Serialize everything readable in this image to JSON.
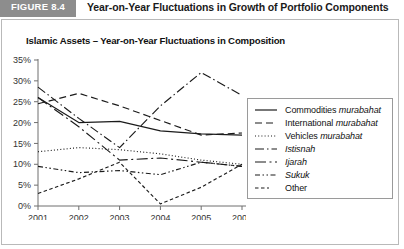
{
  "figure": {
    "badge": "FIGURE 8.4",
    "header_title": "Year-on-Year Fluctuations in Growth of Portfolio Components"
  },
  "chart_data": {
    "type": "line",
    "title": "Islamic Assets – Year-on-Year Fluctuations in Composition",
    "xlabel": "",
    "ylabel": "",
    "categories": [
      "2001",
      "2002",
      "2003",
      "2004",
      "2005",
      "2006"
    ],
    "x": [
      2001,
      2002,
      2003,
      2004,
      2005,
      2006
    ],
    "ylim": [
      0,
      35
    ],
    "yticks": [
      0,
      5,
      10,
      15,
      20,
      25,
      30,
      35
    ],
    "ytick_labels": [
      "0%",
      "5%",
      "10%",
      "15%",
      "20%",
      "25%",
      "30%",
      "35%"
    ],
    "grid": false,
    "legend_position": "right",
    "series": [
      {
        "name": "Commodities murabahat",
        "label_plain": "Commodities ",
        "label_italic": "murabahat",
        "dash": "solid",
        "values": [
          26.0,
          20.0,
          20.3,
          18.0,
          17.3,
          17.0
        ]
      },
      {
        "name": "International murabahat",
        "label_plain": "International ",
        "label_italic": "murabahat",
        "dash": "dashed",
        "values": [
          24.5,
          27.0,
          24.0,
          20.5,
          17.0,
          17.5
        ]
      },
      {
        "name": "Vehicles murabahat",
        "label_plain": "Vehicles ",
        "label_italic": "murabahat",
        "dash": "dotted",
        "values": [
          13.0,
          14.0,
          13.5,
          12.5,
          11.0,
          10.0
        ]
      },
      {
        "name": "Istisnah",
        "label_plain": "",
        "label_italic": "Istisnah",
        "dash": "dashdot",
        "values": [
          28.5,
          21.0,
          14.0,
          24.0,
          32.0,
          26.5
        ]
      },
      {
        "name": "Ijarah",
        "label_plain": "",
        "label_italic": "Ijarah",
        "dash": "longdashdot",
        "values": [
          26.0,
          19.0,
          11.0,
          11.5,
          10.5,
          9.5
        ]
      },
      {
        "name": "Sukuk",
        "label_plain": "",
        "label_italic": "Sukuk",
        "dash": "dashdotdot",
        "values": [
          9.5,
          8.0,
          8.5,
          7.5,
          10.5,
          9.5
        ]
      },
      {
        "name": "Other",
        "label_plain": "Other",
        "label_italic": "",
        "dash": "short",
        "values": [
          3.0,
          6.5,
          10.5,
          0.5,
          4.5,
          10.0
        ]
      }
    ]
  }
}
